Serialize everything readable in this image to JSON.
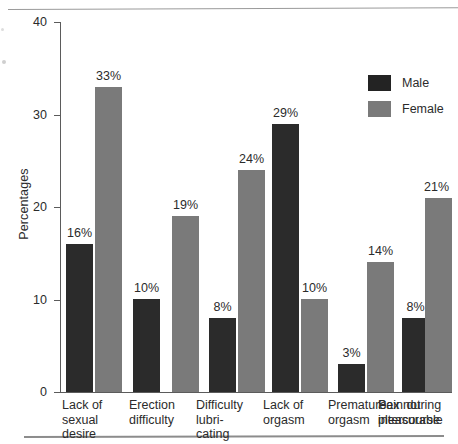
{
  "chart_data": {
    "type": "bar",
    "title": "",
    "xlabel": "",
    "ylabel": "Percentages",
    "ylim": [
      0,
      40
    ],
    "yticks": [
      "0",
      "10",
      "20",
      "30",
      "40"
    ],
    "grid": false,
    "legend_position": "top-right",
    "categories": [
      "Lack of sexual desire",
      "Erection difficulty",
      "Difficulty lubricating",
      "Lack of orgasm",
      "Premature orgasm",
      "Pain during intercourse",
      "Sex not pleasurable"
    ],
    "category_lines": [
      [
        "Lack of",
        "sexual",
        "desire"
      ],
      [
        "Erection",
        "difficulty"
      ],
      [
        "Difficulty",
        "lubri-",
        "cating"
      ],
      [
        "Lack of",
        "orgasm"
      ],
      [
        "Premature",
        "orgasm"
      ],
      [
        "Pain during",
        "intercourse"
      ],
      [
        "Sex not",
        "pleasurable"
      ]
    ],
    "series": [
      {
        "name": "Male",
        "color": "#2b2b2b",
        "values": [
          16,
          10,
          null,
          8,
          29,
          3,
          8
        ],
        "labels": [
          "16%",
          "10%",
          null,
          "8%",
          "29%",
          "3%",
          "8%"
        ]
      },
      {
        "name": "Female",
        "color": "#7a7a7a",
        "values": [
          33,
          null,
          19,
          24,
          10,
          14,
          21
        ],
        "labels": [
          "33%",
          null,
          "19%",
          "24%",
          "10%",
          "14%",
          "21%"
        ]
      }
    ]
  },
  "axis": {
    "y_title": "Percentages",
    "tick_40": "40",
    "tick_30": "30",
    "tick_20": "20",
    "tick_10": "10",
    "tick_0": "0"
  },
  "legend": {
    "male_label": "Male",
    "female_label": "Female"
  },
  "bar_labels": {
    "b1": "16%",
    "b2": "33%",
    "b3": "10%",
    "b4": "19%",
    "b5": "8%",
    "b6": "24%",
    "b7": "29%",
    "b8": "10%",
    "b9": "3%",
    "b10": "14%",
    "b11": "8%",
    "b12": "21%"
  },
  "categories_text": {
    "c1l1": "Lack of",
    "c1l2": "sexual",
    "c1l3": "desire",
    "c2l1": "Erection",
    "c2l2": "difficulty",
    "c3l1": "Difficulty",
    "c3l2": "lubri-",
    "c3l3": "cating",
    "c4l1": "Lack of",
    "c4l2": "orgasm",
    "c5l1": "Premature",
    "c5l2": "orgasm",
    "c6l1": "Pain during",
    "c6l2": "intercourse",
    "c7l1": "Sex not",
    "c7l2": "pleasurable"
  }
}
